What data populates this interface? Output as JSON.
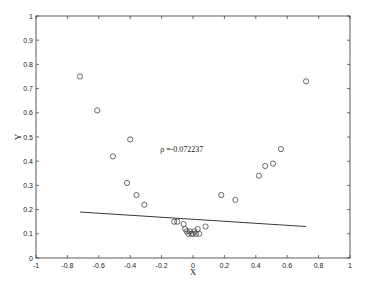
{
  "chart_data": {
    "type": "scatter",
    "title": "",
    "xlabel": "X",
    "ylabel": "Y",
    "xlim": [
      -1,
      1
    ],
    "ylim": [
      0,
      1
    ],
    "grid": false,
    "legend": null,
    "x_ticks": [
      "-1",
      "-0.8",
      "-0.6",
      "-0.4",
      "-0.2",
      "0",
      "0.2",
      "0.4",
      "0.6",
      "0.8",
      "1"
    ],
    "y_ticks": [
      "0",
      "0.1",
      "0.2",
      "0.3",
      "0.4",
      "0.5",
      "0.6",
      "0.7",
      "0.8",
      "0.9",
      "1"
    ],
    "annotation": {
      "text": "ρ =-0.072237",
      "x": -0.12,
      "y": 0.5
    },
    "series": [
      {
        "name": "data",
        "marker": "circle-open",
        "points": [
          [
            -0.72,
            0.75
          ],
          [
            -0.61,
            0.61
          ],
          [
            -0.51,
            0.42
          ],
          [
            -0.4,
            0.49
          ],
          [
            -0.42,
            0.31
          ],
          [
            -0.36,
            0.26
          ],
          [
            -0.31,
            0.22
          ],
          [
            -0.12,
            0.15
          ],
          [
            -0.1,
            0.15
          ],
          [
            -0.06,
            0.14
          ],
          [
            -0.05,
            0.12
          ],
          [
            -0.04,
            0.11
          ],
          [
            -0.03,
            0.1
          ],
          [
            -0.02,
            0.11
          ],
          [
            -0.01,
            0.1
          ],
          [
            0.0,
            0.1
          ],
          [
            0.01,
            0.11
          ],
          [
            0.02,
            0.1
          ],
          [
            0.03,
            0.12
          ],
          [
            0.04,
            0.1
          ],
          [
            0.08,
            0.13
          ],
          [
            0.18,
            0.26
          ],
          [
            0.27,
            0.24
          ],
          [
            0.42,
            0.34
          ],
          [
            0.46,
            0.38
          ],
          [
            0.51,
            0.39
          ],
          [
            0.56,
            0.45
          ],
          [
            0.72,
            0.73
          ]
        ]
      },
      {
        "name": "fit",
        "type": "line",
        "points": [
          [
            -0.72,
            0.19
          ],
          [
            0.72,
            0.13
          ]
        ]
      }
    ]
  }
}
